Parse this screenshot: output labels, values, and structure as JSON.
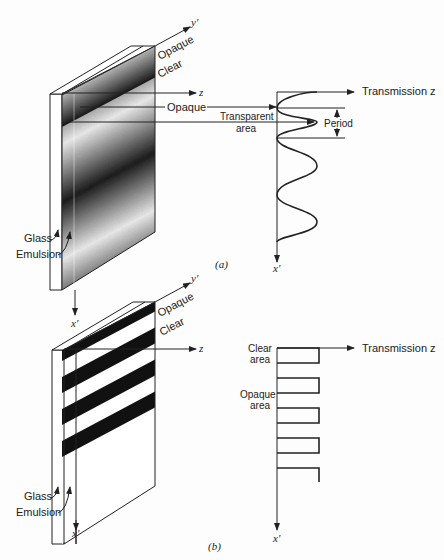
{
  "figure": {
    "panel_a": {
      "caption": "(a)",
      "plate": {
        "type": "sinusoidal-grating",
        "labels": {
          "opaque_top": "Opaque",
          "clear_top": "Clear",
          "opaque_side": "Opaque",
          "transparent": "Transparent",
          "transparent_2": "area",
          "glass": "Glass",
          "emulsion": "Emulsion"
        },
        "axes": {
          "y": "y'",
          "z": "z",
          "x": "x'"
        }
      },
      "profile": {
        "type": "sinusoidal",
        "title": "Transmission z",
        "period_label": "Period",
        "x_axis": "x'",
        "cycles": 4
      }
    },
    "panel_b": {
      "caption": "(b)",
      "plate": {
        "type": "square-wave-grating",
        "labels": {
          "opaque_top": "Opaque",
          "clear_top": "Clear",
          "glass": "Glass",
          "emulsion": "Emulsion"
        },
        "axes": {
          "y": "y'",
          "z": "z",
          "x": "x'"
        }
      },
      "profile": {
        "type": "square-wave",
        "title": "Transmission z",
        "clear_label": "Clear",
        "clear_label_2": "area",
        "opaque_label": "Opaque",
        "opaque_label_2": "area",
        "x_axis": "x'",
        "cycles": 5
      }
    }
  }
}
